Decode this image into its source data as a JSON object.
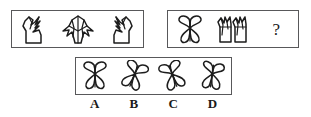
{
  "puzzle": {
    "type": "visual-analogy-multiple-choice",
    "stem_panel": {
      "name": "top-left-sequence",
      "figures": [
        {
          "id": "stem-1",
          "icon": "angular-flame-left-figure"
        },
        {
          "id": "stem-2",
          "icon": "angular-tent-symmetric-figure"
        },
        {
          "id": "stem-3",
          "icon": "angular-flame-right-figure"
        }
      ]
    },
    "query_panel": {
      "name": "top-right-sequence",
      "figures": [
        {
          "id": "query-1",
          "icon": "butterfly-four-lobe-figure"
        },
        {
          "id": "query-2",
          "icon": "double-mirrored-tulip-figure"
        }
      ],
      "missing_marker": "?"
    },
    "options_panel": {
      "name": "answer-options",
      "options": [
        {
          "label": "A",
          "icon": "butterfly-upright-figure"
        },
        {
          "label": "B",
          "icon": "butterfly-rotated-figure"
        },
        {
          "label": "C",
          "icon": "butterfly-tilted-figure"
        },
        {
          "label": "D",
          "icon": "butterfly-pinwheel-figure"
        }
      ]
    },
    "colors": {
      "ink": "#1d1d1d",
      "border": "#58585a",
      "background": "#ffffff"
    }
  }
}
